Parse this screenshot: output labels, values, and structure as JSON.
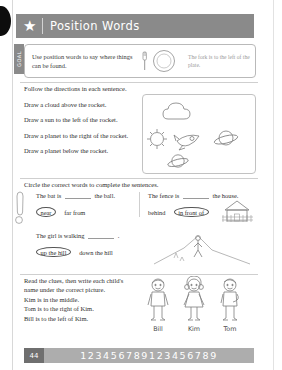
{
  "header": {
    "title": "Position Words",
    "star_icon": "star-icon"
  },
  "goal": {
    "tab_label": "GOAL",
    "text": "Use position words to say where things can be found.",
    "example": "The fork is to the left of the plate.",
    "art": "fork-and-plate-icon"
  },
  "section1": {
    "prompt": "Follow the directions in each sentence.",
    "items": [
      "Draw a cloud above the rocket.",
      "Draw a sun to the left of the rocket.",
      "Draw a planet to the right of the rocket.",
      "Draw a planet below the rocket."
    ],
    "drawings": [
      "cloud-drawing",
      "sun-drawing",
      "rocket-drawing",
      "planet-right-drawing",
      "planet-below-drawing"
    ]
  },
  "section2": {
    "prompt": "Circle the correct words to complete the sentences.",
    "questions": [
      {
        "sentence_before": "The bat is",
        "sentence_after": "the ball.",
        "choice_circled": "near",
        "choice_plain": "far from",
        "art": "bat-and-ball-icon"
      },
      {
        "sentence_before": "The fence is",
        "sentence_after": "the house.",
        "choice_plain": "behind",
        "choice_circled": "in front of",
        "art": "house-with-fence-icon"
      }
    ],
    "third": {
      "sentence_before": "The girl is walking",
      "sentence_after": ".",
      "choice_circled": "up the hill",
      "choice_plain": "down the hill",
      "art": "girl-walking-up-hill-icon"
    }
  },
  "section3": {
    "prompt": "Read the clues, then write each child's name under the correct picture.",
    "clues": [
      "Kim is in the middle.",
      "Tom is to the right of Kim.",
      "Bill is to the left of Kim."
    ],
    "kids": [
      {
        "name": "Bill",
        "art": "boy-bill-figure"
      },
      {
        "name": "Kim",
        "art": "girl-kim-figure"
      },
      {
        "name": "Tom",
        "art": "boy-tom-figure"
      }
    ]
  },
  "footer": {
    "page_number": "44",
    "digits": "123456789123456789"
  },
  "colors": {
    "header_gray": "#8a8a8a",
    "footer_gray": "#adadad",
    "page_badge": "#6f6f6f",
    "ink": "#2e2e2e"
  }
}
